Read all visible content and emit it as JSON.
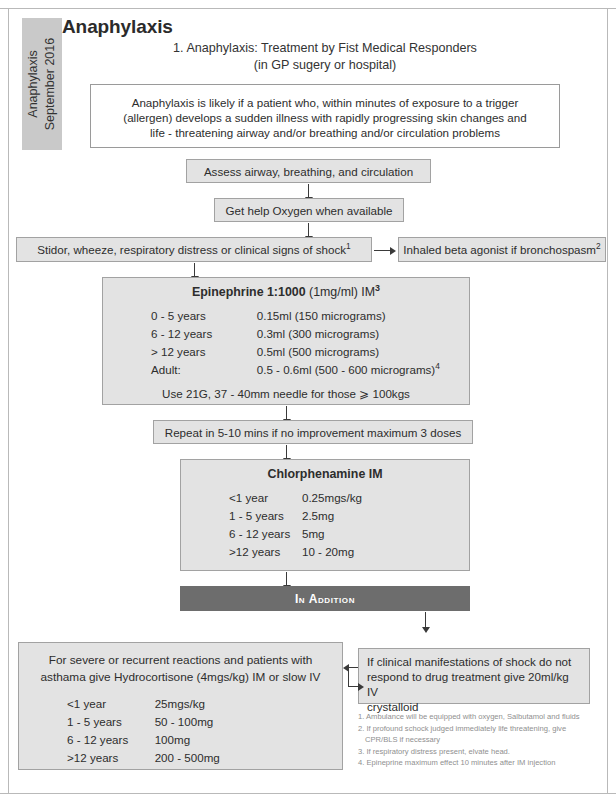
{
  "side_tab": {
    "line1": "Anaphylaxis",
    "line2": "September 2016"
  },
  "header": {
    "title": "Anaphylaxis",
    "subtitle_line1": "1. Anaphylaxis: Treatment by Fist Medical Responders",
    "subtitle_line2": "(in GP sugery or hospital)"
  },
  "definition_box": {
    "line1": "Anaphylaxis is likely if a patient who, within minutes of exposure to a trigger",
    "line2": "(allergen) develops a sudden illness with rapidly progressing skin changes and",
    "line3": "life - threatening airway and/or breathing and/or circulation problems"
  },
  "steps": {
    "assess": "Assess airway, breathing, and circulation",
    "get_help": "Get help Oxygen when available",
    "stridor": "Stidor, wheeze, respiratory distress or clinical signs of shock",
    "stridor_ref": "1",
    "inhaled": "Inhaled beta agonist if bronchospasm",
    "inhaled_ref": "2",
    "repeat": "Repeat in 5-10 mins if no improvement maximum 3 doses",
    "in_addition": "In Addition"
  },
  "epinephrine": {
    "title_bold": "Epinephrine 1:1000",
    "title_light": " (1mg/ml) IM",
    "title_ref": "3",
    "rows": [
      {
        "age": "0 - 5 years",
        "dose": "0.15ml (150 micrograms)",
        "ref": ""
      },
      {
        "age": "6 - 12 years",
        "dose": "0.3ml (300 micrograms)",
        "ref": ""
      },
      {
        "age": "> 12 years",
        "dose": "0.5ml (500 micrograms)",
        "ref": ""
      },
      {
        "age": "Adult:",
        "dose": "0.5 - 0.6ml (500 - 600 micrograms)",
        "ref": "4"
      }
    ],
    "needle_note": "Use 21G, 37 - 40mm needle for those ⩾ 100kgs"
  },
  "chlorphenamine": {
    "title": "Chlorphenamine IM",
    "rows": [
      {
        "age": "<1 year",
        "dose": "0.25mgs/kg"
      },
      {
        "age": "1 - 5 years",
        "dose": "2.5mg"
      },
      {
        "age": "6 - 12 years",
        "dose": "5mg"
      },
      {
        "age": ">12 years",
        "dose": "10 - 20mg"
      }
    ]
  },
  "hydrocortisone": {
    "head_line1": "For severe or recurrent reactions and patients with",
    "head_line2": "asthama give Hydrocortisone (4mgs/kg) IM or slow IV",
    "rows": [
      {
        "age": "<1 year",
        "dose": "25mgs/kg"
      },
      {
        "age": "1 - 5 years",
        "dose": "50 - 100mg"
      },
      {
        "age": "6 - 12 years",
        "dose": "100mg"
      },
      {
        "age": ">12 years",
        "dose": "200 - 500mg"
      }
    ]
  },
  "shock_box": {
    "line1": "If clinical manifestations of shock do not",
    "line2": "respond to drug treatment give 20ml/kg IV",
    "line3": "crystalloid"
  },
  "footnotes": {
    "note1": "1. Ambulance will be equipped with oxygen, Salbutamol and fluids",
    "note2": "2. If profound schock judged immediately life threatening, give",
    "note2b": "CPR/BLS if necessary",
    "note3": "3. If respiratory distress present, elvate head.",
    "note4": "4. Epineprine maximum effect 10 minutes after IM injection"
  },
  "colors": {
    "grey_box": "#e3e3e3",
    "banner": "#6d6d6d",
    "side_tab": "#c9c9c9",
    "text": "#2d2d2d",
    "footnote_text": "#8f8f8f"
  }
}
